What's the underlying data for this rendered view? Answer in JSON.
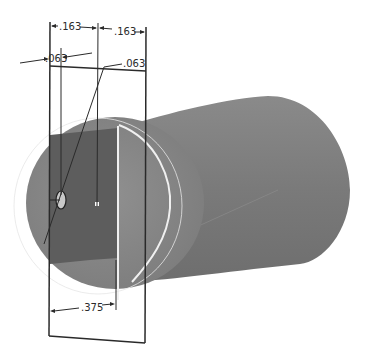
{
  "drawing": {
    "type": "cad-sketch-on-cylinder",
    "colors": {
      "background": "#ffffff",
      "cylinder_body": "#7d7d7d",
      "cylinder_dark": "#6b6b6b",
      "cylinder_front_face": "#8c8c8c",
      "cylinder_end_face": "#888888",
      "cut_region": "#5e5e5e",
      "sketch_line": "#2a2a2a",
      "highlight_edge": "#f2f2f2",
      "ghost_circle": "#e6e6e6",
      "hole": "#bdbdbd"
    },
    "dimensions": [
      {
        "id": "top-left-width",
        "label": ".163"
      },
      {
        "id": "top-right-width",
        "label": ".163"
      },
      {
        "id": "hole-offset-left",
        "label": ".063"
      },
      {
        "id": "hole-diameter-leader",
        "label": ".063"
      },
      {
        "id": "bottom-width",
        "label": ".375"
      }
    ]
  }
}
